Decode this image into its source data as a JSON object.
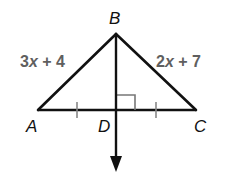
{
  "diagram": {
    "type": "geometry-triangle",
    "points": {
      "A": {
        "label": "A",
        "x": 38,
        "y": 110
      },
      "B": {
        "label": "B",
        "x": 116,
        "y": 34
      },
      "C": {
        "label": "C",
        "x": 196,
        "y": 110
      },
      "D": {
        "label": "D",
        "x": 116,
        "y": 110
      }
    },
    "side_labels": {
      "AB": {
        "coef": "3",
        "var": "x",
        "rest": " + 4",
        "full": "3x + 4"
      },
      "BC": {
        "coef": "2",
        "var": "x",
        "rest": " + 7",
        "full": "2x + 7"
      }
    },
    "marks": {
      "congruent_ticks": [
        "AD",
        "DC"
      ],
      "right_angle_at": "D"
    },
    "ray": {
      "from": "B",
      "through": "D",
      "arrow": "down"
    },
    "colors": {
      "lines": "#111111",
      "expressions": "#5f5f5f",
      "right_angle_marker": "#777777",
      "tick_marks": "#888888"
    }
  }
}
